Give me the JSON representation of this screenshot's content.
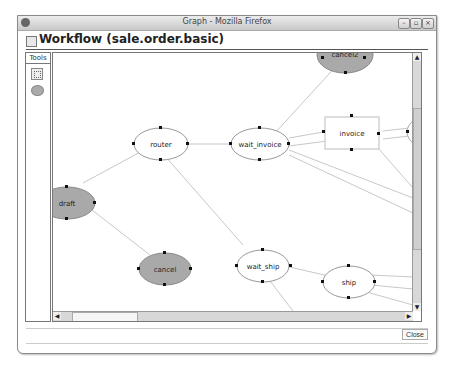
{
  "browser": {
    "title": "Graph - Mozilla Firefox",
    "controls": [
      "minimize",
      "maximize",
      "close"
    ]
  },
  "header": {
    "title": "Workflow (sale.order.basic)"
  },
  "tools": {
    "label": "Tools",
    "items": [
      {
        "name": "select-tool",
        "icon": "dotted-square"
      },
      {
        "name": "state-tool",
        "icon": "gray-ellipse"
      }
    ]
  },
  "graph": {
    "nodes": [
      {
        "id": "draft",
        "label": "draft",
        "type": "start",
        "fill": "#a9a9a9"
      },
      {
        "id": "router",
        "label": "router",
        "type": "activity",
        "fill": "#ffffff"
      },
      {
        "id": "wait_invoice",
        "label": "wait_invoice",
        "type": "activity",
        "fill": "#ffffff"
      },
      {
        "id": "invoice",
        "label": "invoice",
        "type": "subflow",
        "fill": "#ffffff"
      },
      {
        "id": "cancel2",
        "label": "cancel2",
        "type": "stop",
        "fill": "#a9a9a9"
      },
      {
        "id": "cancel",
        "label": "cancel",
        "type": "stop",
        "fill": "#a9a9a9"
      },
      {
        "id": "wait_ship",
        "label": "wait_ship",
        "type": "activity",
        "fill": "#ffffff"
      },
      {
        "id": "ship",
        "label": "ship",
        "type": "activity",
        "fill": "#ffffff"
      },
      {
        "id": "inv_partial",
        "label": "in",
        "type": "activity",
        "fill": "#ffffff"
      }
    ]
  },
  "footer": {
    "close_label": "Close"
  }
}
